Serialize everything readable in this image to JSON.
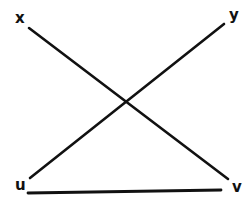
{
  "diagram": {
    "stroke_color": "#111111",
    "background": "#ffffff",
    "labels": {
      "x": "x",
      "y": "y",
      "u": "u",
      "v": "v"
    },
    "segments": [
      {
        "name": "x-to-v",
        "from": "x",
        "to": "v",
        "x1": 29,
        "y1": 28,
        "x2": 228,
        "y2": 179
      },
      {
        "name": "y-to-u",
        "from": "y",
        "to": "u",
        "x1": 224,
        "y1": 24,
        "x2": 30,
        "y2": 178
      },
      {
        "name": "u-to-v",
        "from": "u",
        "to": "v",
        "x1": 28,
        "y1": 193,
        "x2": 221,
        "y2": 190
      }
    ],
    "intersection": {
      "x": 124,
      "y": 100
    }
  }
}
